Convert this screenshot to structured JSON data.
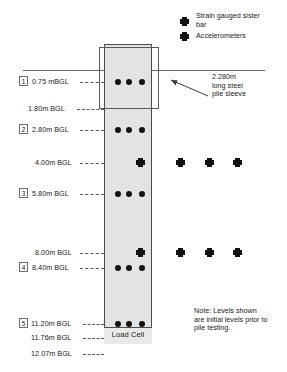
{
  "figure": {
    "pile_label": "Load Cell",
    "sleeve_annotation": "2.280m\nlong steel\npile sleeve",
    "note": "Note: Levels shown\nare initial levels prior to\npile testing."
  },
  "legend": {
    "items": [
      {
        "marker": "circle-marker-icon",
        "label": "Strain gauged sister\nbar"
      },
      {
        "marker": "cross-marker-icon",
        "label": "Accelerometers"
      }
    ]
  },
  "levels": [
    {
      "number": "1",
      "text": "0.75 mBGL",
      "has_box": true
    },
    {
      "number": "",
      "text": "1.80m BGL",
      "has_box": false
    },
    {
      "number": "2",
      "text": "2.80m BGL",
      "has_box": true
    },
    {
      "number": "",
      "text": "4.00m BGL",
      "has_box": false
    },
    {
      "number": "3",
      "text": "5.80m BGL",
      "has_box": true
    },
    {
      "number": "",
      "text": "8.00m BGL",
      "has_box": false
    },
    {
      "number": "4",
      "text": "8.40m BGL",
      "has_box": true
    },
    {
      "number": "5",
      "text": "11.20m BGL",
      "has_box": true
    },
    {
      "number": "",
      "text": "11.76m BGL",
      "has_box": false
    },
    {
      "number": "",
      "text": "12.07m BGL",
      "has_box": false
    }
  ],
  "colors": {
    "pile_fill": "#e3e3e3",
    "outline": "#4b4b4b",
    "marker": "#111111",
    "text": "#1a1a1a"
  }
}
